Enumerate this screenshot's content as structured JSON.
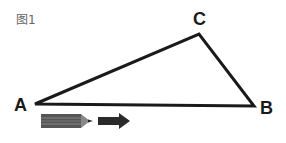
{
  "figure": {
    "label": "图1",
    "vertices": {
      "A": {
        "label": "A",
        "x": 35,
        "y": 104
      },
      "B": {
        "label": "B",
        "x": 254,
        "y": 106
      },
      "C": {
        "label": "C",
        "x": 199,
        "y": 34
      }
    },
    "stroke_color": "#1a1a1a",
    "pencil": {
      "body_color": "#555555",
      "stripe_color": "#888888"
    },
    "arrow": {
      "color": "#2a2a2a",
      "direction": "right"
    }
  }
}
